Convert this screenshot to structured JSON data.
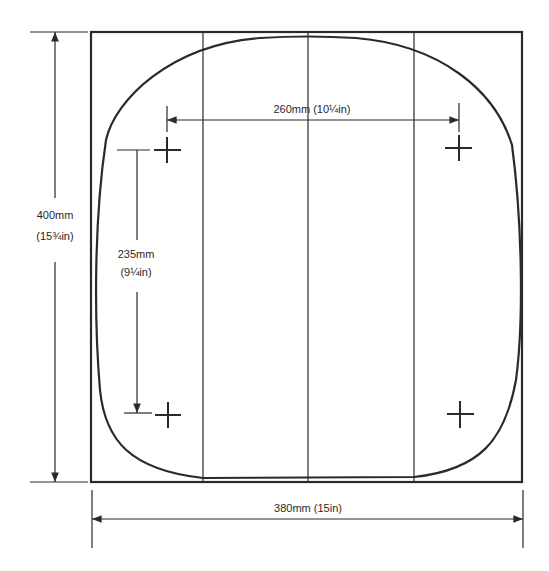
{
  "diagram": {
    "type": "dimensioned template drawing",
    "outline": {
      "shape": "rounded square seat outline inside square frame",
      "frame_width": "380mm (15in)",
      "frame_height": "400mm (15¾in)"
    },
    "dimensions": {
      "height": {
        "mm": "400mm",
        "in": "(15¾in)"
      },
      "width": {
        "label": "380mm (15in)"
      },
      "hole_spacing_horizontal": {
        "label": "260mm (10¼in)"
      },
      "hole_spacing_vertical": {
        "mm": "235mm",
        "in": "(9¼in)"
      }
    },
    "markers": [
      {
        "name": "top-left-crosshair"
      },
      {
        "name": "top-right-crosshair"
      },
      {
        "name": "bottom-left-crosshair"
      },
      {
        "name": "bottom-right-crosshair"
      }
    ],
    "divider_lines": 3,
    "colors": {
      "line": "#2a2a2a",
      "background": "#ffffff"
    }
  }
}
